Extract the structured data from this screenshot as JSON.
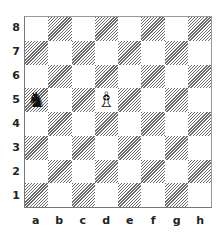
{
  "board": {
    "files": [
      "a",
      "b",
      "c",
      "d",
      "e",
      "f",
      "g",
      "h"
    ],
    "ranks": [
      "8",
      "7",
      "6",
      "5",
      "4",
      "3",
      "2",
      "1"
    ],
    "light_color": "#ffffff",
    "dark_style": "diagonal-hatch",
    "pieces": [
      {
        "square": "a5",
        "piece": "knight",
        "color": "black",
        "glyph": "♞"
      },
      {
        "square": "d5",
        "piece": "bishop",
        "color": "white",
        "glyph": "♗"
      }
    ]
  }
}
